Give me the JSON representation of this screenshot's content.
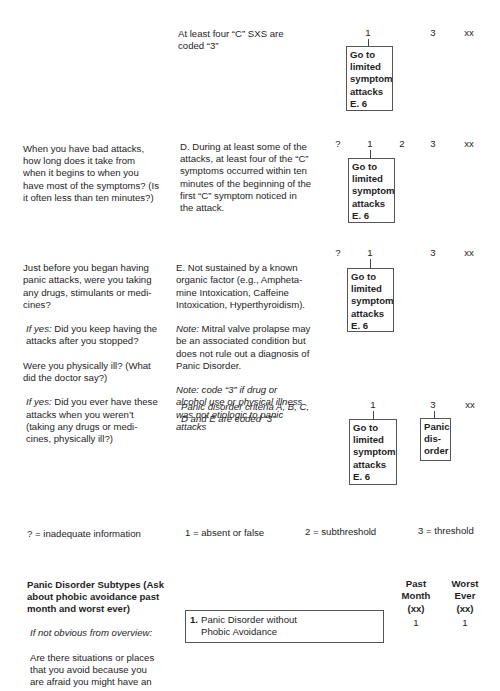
{
  "sections": [
    {
      "id": "c-summary",
      "question": "",
      "criterion": "At least four “C” SXS are\ncoded “3”",
      "codes": [
        "1",
        "3",
        "xx"
      ],
      "box": "Go to\nlimited\nsymptom\nattacks\nE. 6"
    },
    {
      "id": "criterion-d",
      "question": "When you have bad attacks,\nhow long does it take from\nwhen it begins to when you\nhave most of the symptoms? (Is\nit often less than ten minutes?)",
      "criterion": "D. During at least some of the\nattacks, at least four of the “C”\nsymptoms occurred within ten\nminutes of the beginning of the\nfirst “C” symptom noticed in\nthe attack.",
      "codes": [
        "?",
        "1",
        "2",
        "3",
        "xx"
      ],
      "box": "Go to\nlimited\nsymptom\nattacks\nE. 6"
    },
    {
      "id": "criterion-e",
      "question_parts": [
        {
          "text": "Just before you began having\npanic attacks, were you taking\nany drugs, stimulants or medi-\ncines?",
          "italic_prefix": ""
        },
        {
          "italic_prefix": "If yes:",
          "text": " Did you keep having the\nattacks after you stopped?"
        },
        {
          "text": "Were you physically ill? (What\ndid the doctor say?)",
          "italic_prefix": ""
        },
        {
          "italic_prefix": "If yes:",
          "text": " Did you ever have these\nattacks when you weren’t\n(taking any drugs or medi-\ncines, physically ill?)"
        }
      ],
      "criterion_main": "E. Not sustained by a known\norganic factor (e.g., Ampheta-\nmine Intoxication, Caffeine\nIntoxication, Hyperthyroidism).",
      "criterion_note1_prefix": "Note:",
      "criterion_note1": " Mitral valve prolapse may\nbe an associated condition but\ndoes not rule out a diagnosis of\nPanic Disorder.",
      "criterion_note2": "Note: code “3” if drug or\nalcohol use or physical illness\nwas not etiologic to panic\nattacks",
      "codes": [
        "?",
        "1",
        "3",
        "xx"
      ],
      "box": "Go to\nlimited\nsymptom\nattacks\nE. 6"
    },
    {
      "id": "panic-summary",
      "criterion": "Panic disorder criteria A, B, C,\nD and E are coded “3”",
      "codes": [
        "1",
        "3",
        "xx"
      ],
      "box_1": "Go to\nlimited\nsymptom\nattacks\nE. 6",
      "box_3": "Panic\ndis-\norder"
    }
  ],
  "legend": {
    "q": "? = inadequate information",
    "one": "1 = absent or false",
    "two": "2 = subthreshold",
    "three": "3 = threshold"
  },
  "subtypes": {
    "title": "Panic Disorder Subtypes (Ask\nabout phobic avoidance past\nmonth and worst ever)",
    "prompt_prefix": "If not obvious from overview:",
    "prompt": "Are there situations or places\nthat you avoid because you\nare afraid you might have an",
    "col_past": "Past\nMonth\n(xx)",
    "col_worst": "Worst\nEver\n(xx)",
    "items": [
      {
        "num": "1.",
        "label": "Panic Disorder without\nPhobic Avoidance",
        "past": "1",
        "worst": "1"
      }
    ]
  }
}
